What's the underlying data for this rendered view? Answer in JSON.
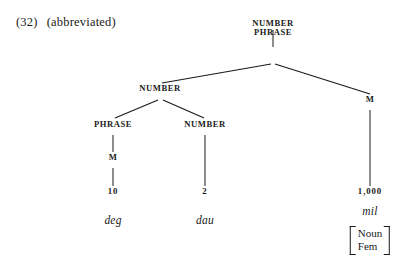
{
  "page": {
    "background_color": "#ffffff",
    "ink_color": "#1a1a1a"
  },
  "header": {
    "example_number": "(32)",
    "note": "(abbreviated)"
  },
  "tree": {
    "description": "Syntactic tree for a Welsh numeral phrase",
    "nodes": {
      "root_line1": "NUMBER",
      "root_line2": "PHRASE",
      "left_number": "NUMBER",
      "left_phrase": "PHRASE",
      "mid_number": "NUMBER",
      "left_m": "M",
      "right_m": "M",
      "terminal_ten": "10",
      "terminal_two": "2",
      "terminal_thousand": "1,000"
    },
    "lexical_items": {
      "deg": "deg",
      "dau": "dau",
      "mil": "mil"
    },
    "feature_matrix": {
      "feature_1": "Noun",
      "feature_2": "Fem"
    }
  }
}
